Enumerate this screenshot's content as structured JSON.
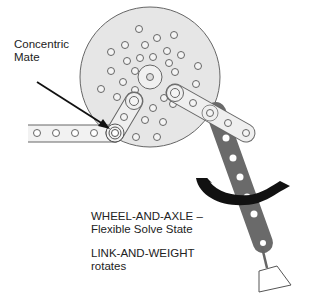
{
  "labels": {
    "concentric_mate": [
      "Concentric",
      "Mate"
    ],
    "wheel_and_axle": [
      "WHEEL-AND-AXLE –",
      "Flexible Solve State"
    ],
    "link_and_weight": [
      "LINK-AND-WEIGHT",
      "rotates"
    ]
  },
  "components": {
    "wheel": "disk-with-holes",
    "left_link": "horizontal-link",
    "short_link": "connector-link",
    "right_link": "upper-link",
    "hanging_link": "gray-link",
    "weight": "trapezoid-weight",
    "rotation_arrow": "curved-rotation-arrow",
    "pointer_arrow": "mate-pointer-arrow"
  },
  "colors": {
    "disk_fill": "#e6e6e6",
    "outline": "#555555",
    "gray_link": "#666666",
    "arrow": "#111111",
    "text": "#222222"
  }
}
